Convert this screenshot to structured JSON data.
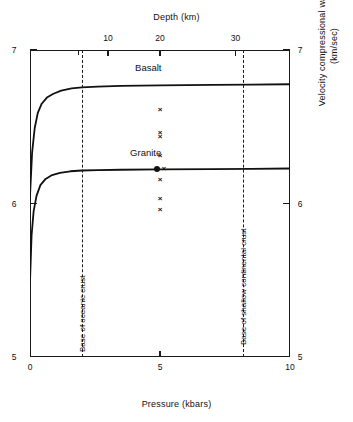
{
  "chart_data": {
    "type": "line",
    "title": "",
    "xlabel": "Pressure (kbars)",
    "ylabel": "Velocity compressional wave (km/sec)",
    "ylabel_line1": "Velocity compressional wave",
    "ylabel_line2": "(km/sec)",
    "top_axis_label": "Depth (km)",
    "xlim": [
      0,
      10
    ],
    "ylim": [
      5,
      7
    ],
    "top_xlim_depth": [
      0,
      37
    ],
    "grid": false,
    "legend_position": "inline-labels",
    "x_ticks": [
      0,
      5,
      10
    ],
    "x_tick_labels": [
      "0",
      "5",
      "10"
    ],
    "y_ticks": [
      5,
      6,
      7
    ],
    "y_tick_labels_left": [
      "5",
      "6",
      "7"
    ],
    "y_tick_labels_right": [
      "5",
      "6",
      "7"
    ],
    "depth_ticks": [
      10,
      20,
      30
    ],
    "depth_tick_labels": [
      "10",
      "20",
      "30"
    ],
    "depth_minor_ticks": [
      7,
      20,
      30
    ],
    "series": [
      {
        "name": "Basalt",
        "label": "Basalt",
        "plateau_velocity": 6.77,
        "x": [
          0.0,
          0.08,
          0.18,
          0.3,
          0.45,
          0.65,
          0.9,
          1.2,
          1.6,
          2.0,
          2.6,
          3.5,
          5.0,
          7.0,
          8.5,
          10.0
        ],
        "y": [
          6.05,
          6.33,
          6.49,
          6.59,
          6.65,
          6.69,
          6.715,
          6.735,
          6.75,
          6.757,
          6.762,
          6.766,
          6.77,
          6.773,
          6.775,
          6.777
        ]
      },
      {
        "name": "Granite",
        "label": "Granite",
        "plateau_velocity": 6.22,
        "x": [
          0.0,
          0.06,
          0.14,
          0.25,
          0.4,
          0.6,
          0.85,
          1.15,
          1.55,
          2.0,
          2.6,
          3.5,
          5.0,
          7.0,
          8.5,
          10.0
        ],
        "y": [
          5.49,
          5.79,
          5.95,
          6.05,
          6.12,
          6.16,
          6.185,
          6.2,
          6.21,
          6.215,
          6.218,
          6.22,
          6.222,
          6.224,
          6.226,
          6.228
        ]
      }
    ],
    "markers": [
      {
        "marker": "x",
        "x": 5.0,
        "y": 6.61
      },
      {
        "marker": "x",
        "x": 5.0,
        "y": 6.46
      },
      {
        "marker": "x",
        "x": 5.0,
        "y": 6.43
      },
      {
        "marker": "x",
        "x": 5.0,
        "y": 6.31
      },
      {
        "marker": "x",
        "x": 5.15,
        "y": 6.225
      },
      {
        "marker": "x",
        "x": 5.0,
        "y": 6.15
      },
      {
        "marker": "x",
        "x": 5.0,
        "y": 6.03
      },
      {
        "marker": "x",
        "x": 5.0,
        "y": 5.96
      },
      {
        "marker": "dot",
        "x": 4.88,
        "y": 6.225
      }
    ],
    "vertical_lines": [
      {
        "label": "Base of oceanic crust",
        "pressure": 2.0
      },
      {
        "label": "Base of shallow continental crust",
        "pressure": 8.2
      }
    ],
    "colors": {
      "axis": "#1a1a1a",
      "curve": "#111111",
      "dashed": "#1a1a1a",
      "background": "#ffffff"
    }
  }
}
